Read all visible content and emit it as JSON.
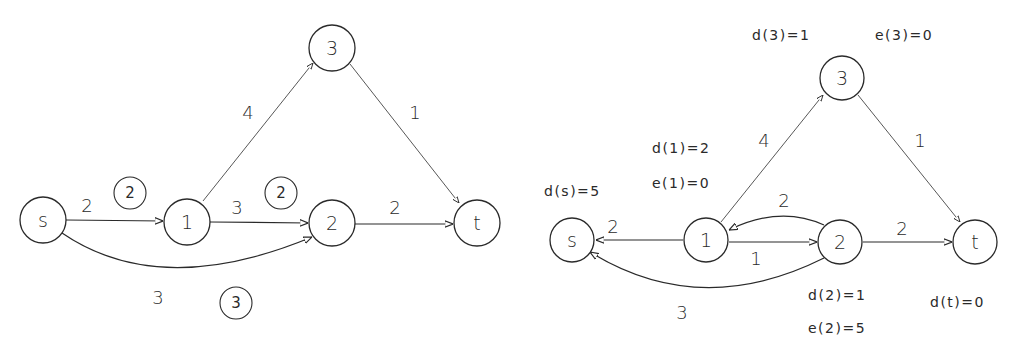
{
  "left_graph": {
    "nodes": {
      "s": {
        "label": "s"
      },
      "n1": {
        "label": "1"
      },
      "n2": {
        "label": "2"
      },
      "n3": {
        "label": "3"
      },
      "t": {
        "label": "t"
      }
    },
    "edges": {
      "s_1": {
        "capacity": "2",
        "flow": "2"
      },
      "1_2": {
        "capacity": "3",
        "flow": "2"
      },
      "1_3": {
        "capacity": "4"
      },
      "3_t": {
        "capacity": "1"
      },
      "2_t": {
        "capacity": "2"
      },
      "s_2": {
        "capacity": "3",
        "flow": "3"
      }
    }
  },
  "right_graph": {
    "nodes": {
      "s": {
        "label": "s"
      },
      "n1": {
        "label": "1"
      },
      "n2": {
        "label": "2"
      },
      "n3": {
        "label": "3"
      },
      "t": {
        "label": "t"
      }
    },
    "edges": {
      "1_s": {
        "capacity": "2"
      },
      "1_3": {
        "capacity": "4"
      },
      "3_t": {
        "capacity": "1"
      },
      "2_1": {
        "capacity": "2"
      },
      "1_2": {
        "capacity": "1"
      },
      "2_t": {
        "capacity": "2"
      },
      "2_s": {
        "capacity": "3"
      }
    },
    "annotations": {
      "d3": "d(3)=1",
      "e3": "e(3)=0",
      "d1": "d(1)=2",
      "e1": "e(1)=0",
      "ds": "d(s)=5",
      "d2": "d(2)=1",
      "e2": "e(2)=5",
      "dt": "d(t)=0"
    }
  }
}
